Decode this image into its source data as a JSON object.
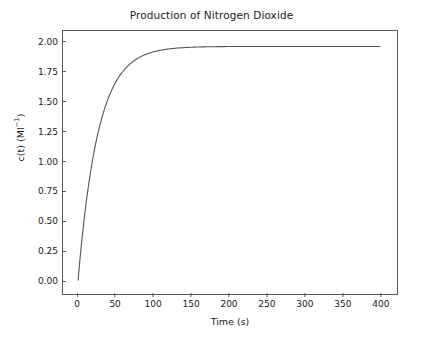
{
  "chart_data": {
    "type": "line",
    "title": "Production of Nitrogen Dioxide",
    "xlabel": "Time (s)",
    "ylabel_prefix": "c(t) (Ml",
    "ylabel_exponent": "−1",
    "ylabel_suffix": ")",
    "ylabel_plain": "c(t) (Ml⁻¹)",
    "xlim": [
      -20,
      420
    ],
    "ylim": [
      -0.1,
      2.1
    ],
    "xticks": [
      0,
      50,
      100,
      150,
      200,
      250,
      300,
      350,
      400
    ],
    "xtick_labels": [
      "0",
      "50",
      "100",
      "150",
      "200",
      "250",
      "300",
      "350",
      "400"
    ],
    "yticks": [
      0.0,
      0.25,
      0.5,
      0.75,
      1.0,
      1.25,
      1.5,
      1.75,
      2.0
    ],
    "ytick_labels": [
      "0.00",
      "0.25",
      "0.50",
      "0.75",
      "1.00",
      "1.25",
      "1.50",
      "1.75",
      "2.00"
    ],
    "grid": false,
    "legend": null,
    "line_color": "#555555",
    "line_width": 1.1,
    "series": [
      {
        "name": "c(t)",
        "description": "Exponential saturation toward 2.00 Ml^-1 with time constant about 30 s",
        "x": [
          0,
          5,
          10,
          15,
          20,
          25,
          30,
          35,
          40,
          45,
          50,
          60,
          70,
          80,
          90,
          100,
          110,
          120,
          130,
          140,
          150,
          160,
          175,
          200,
          225,
          250,
          275,
          300,
          325,
          350,
          375,
          400
        ],
        "y": [
          0.0,
          0.31,
          0.57,
          0.79,
          0.97,
          1.13,
          1.26,
          1.38,
          1.47,
          1.55,
          1.62,
          1.73,
          1.8,
          1.86,
          1.9,
          1.93,
          1.94,
          1.95,
          1.96,
          1.96,
          1.965,
          1.967,
          1.968,
          1.969,
          1.969,
          1.97,
          1.97,
          1.97,
          1.97,
          1.97,
          1.97,
          1.97
        ]
      }
    ],
    "asymptote": 1.97
  },
  "figure": {
    "background_color": "#ffffff",
    "axes_edge_color": "#5a5a5a",
    "text_color": "#1a1a1a"
  }
}
